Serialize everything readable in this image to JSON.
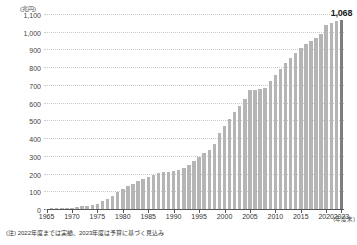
{
  "chart_data": {
    "type": "bar",
    "title": "",
    "unit_label": "(兆円)",
    "xlabel": "(年度末)",
    "ylabel": "",
    "ylim": [
      0,
      1100
    ],
    "ytick_values": [
      0,
      100,
      200,
      300,
      400,
      500,
      600,
      700,
      800,
      900,
      1000,
      1100
    ],
    "ytick_labels": [
      "0",
      "100",
      "200",
      "300",
      "400",
      "500",
      "600",
      "700",
      "800",
      "900",
      "1,000",
      "1,100"
    ],
    "grid": true,
    "legend": "none",
    "xtick_labels": [
      "1965",
      "1970",
      "1975",
      "1980",
      "1985",
      "1990",
      "1995",
      "2000",
      "2005",
      "2010",
      "2015",
      "2020",
      "2023"
    ],
    "xtick_years": [
      1965,
      1970,
      1975,
      1980,
      1985,
      1990,
      1995,
      2000,
      2005,
      2010,
      2015,
      2020,
      2023
    ],
    "categories": [
      1965,
      1966,
      1967,
      1968,
      1969,
      1970,
      1971,
      1972,
      1973,
      1974,
      1975,
      1976,
      1977,
      1978,
      1979,
      1980,
      1981,
      1982,
      1983,
      1984,
      1985,
      1986,
      1987,
      1988,
      1989,
      1990,
      1991,
      1992,
      1993,
      1994,
      1995,
      1996,
      1997,
      1998,
      1999,
      2000,
      2001,
      2002,
      2003,
      2004,
      2005,
      2006,
      2007,
      2008,
      2009,
      2010,
      2011,
      2012,
      2013,
      2014,
      2015,
      2016,
      2017,
      2018,
      2019,
      2020,
      2021,
      2022,
      2023
    ],
    "values": [
      2,
      3,
      4,
      5,
      6,
      8,
      12,
      17,
      19,
      22,
      31,
      43,
      57,
      75,
      95,
      115,
      128,
      142,
      157,
      172,
      183,
      193,
      202,
      207,
      209,
      216,
      222,
      232,
      250,
      269,
      295,
      317,
      332,
      369,
      431,
      468,
      507,
      546,
      581,
      619,
      670,
      674,
      676,
      680,
      720,
      758,
      789,
      821,
      853,
      881,
      911,
      931,
      948,
      966,
      987,
      1036,
      1049,
      1061,
      1068
    ],
    "annotations": [
      {
        "year": 2023,
        "value": 1068,
        "label": "1,068"
      }
    ],
    "highlight_year": 2023,
    "bar_color": "#b5b5b5",
    "highlight_color": "#7d7d7d",
    "footnote": "(注) 2022年度までは実績、2023年度は予算に基づく見込み"
  }
}
